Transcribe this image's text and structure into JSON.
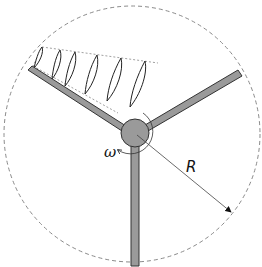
{
  "diagram": {
    "labels": {
      "omega": "ω",
      "radius": "R"
    },
    "elements": {
      "rotor_circle": {
        "style": "dashed",
        "cx": 132,
        "cy": 134,
        "r": 128
      },
      "hub": {
        "cx": 135,
        "cy": 133,
        "r": 14,
        "fill": "#9a9a9a"
      },
      "blades": [
        {
          "name": "left-upper blade",
          "tip": [
            28,
            73
          ]
        },
        {
          "name": "right-upper blade",
          "tip": [
            240,
            73
          ]
        },
        {
          "name": "lower blade",
          "tip": [
            135,
            266
          ]
        }
      ],
      "airfoil_sections": 6,
      "radius_arrow": {
        "from": [
          135,
          133
        ],
        "to": [
          232,
          213
        ]
      }
    },
    "colors": {
      "blade_fill": "#9a9a9a",
      "outline": "#333333",
      "dashed": "#888888"
    }
  }
}
